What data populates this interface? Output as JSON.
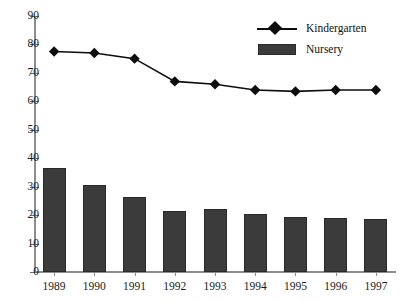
{
  "chart_data": {
    "type": "bar",
    "title": "",
    "subtitle": "",
    "xlabel": "",
    "ylabel": "",
    "categories": [
      "1989",
      "1990",
      "1991",
      "1992",
      "1993",
      "1994",
      "1995",
      "1996",
      "1997"
    ],
    "ylim": [
      0,
      90
    ],
    "y_ticks": [
      0,
      10,
      20,
      30,
      40,
      50,
      60,
      70,
      80,
      90
    ],
    "grid": false,
    "legend_position": "top-right",
    "series": [
      {
        "name": "Kindergarten",
        "type": "line",
        "marker": "diamond",
        "color": "#0d0d0d",
        "values": [
          77.5,
          77.0,
          75.0,
          67.0,
          66.0,
          64.0,
          63.5,
          64.0,
          64.0
        ]
      },
      {
        "name": "Nursery",
        "type": "bar",
        "color": "#3b3b3b",
        "values": [
          36.5,
          30.5,
          26.5,
          21.5,
          22.0,
          20.5,
          19.5,
          19.0,
          18.5
        ]
      }
    ]
  },
  "legend": {
    "items": [
      {
        "label": "Kindergarten",
        "key": "line-diamond-marker"
      },
      {
        "label": "Nursery",
        "key": "filled-rectangle-swatch"
      }
    ]
  },
  "colors": {
    "bar": "#3b3b3b",
    "bar_border": "#2a2a2a",
    "line": "#0d0d0d",
    "axis": "#8d8d8d",
    "text": "#111111",
    "background": "#ffffff"
  }
}
